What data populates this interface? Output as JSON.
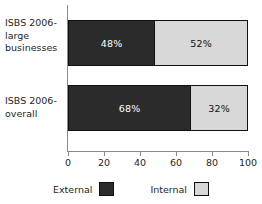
{
  "chart_data": {
    "type": "bar",
    "orientation": "horizontal",
    "stacked": true,
    "percent": true,
    "title": "",
    "subtitle": "",
    "xlabel": "",
    "ylabel": "",
    "categories": [
      "ISBS 2006-large businesses",
      "ISBS 2006-overall"
    ],
    "category_lines": [
      [
        "ISBS 2006-",
        "large",
        "businesses"
      ],
      [
        "ISBS 2006-",
        "overall"
      ]
    ],
    "series": [
      {
        "name": "External",
        "values": [
          48,
          52
        ],
        "color": "#2b2b2b"
      },
      {
        "name": "Internal",
        "values": [
          52,
          32
        ],
        "color": "#d8d8d8"
      }
    ],
    "bars": [
      {
        "category": "ISBS 2006-large businesses",
        "segments": [
          {
            "name": "External",
            "value": 48,
            "label": "48%"
          },
          {
            "name": "Internal",
            "value": 52,
            "label": "52%"
          }
        ]
      },
      {
        "category": "ISBS 2006-overall",
        "segments": [
          {
            "name": "External",
            "value": 68,
            "label": "68%"
          },
          {
            "name": "Internal",
            "value": 32,
            "label": "32%"
          }
        ]
      }
    ],
    "xlim": [
      0,
      100
    ],
    "xticks": [
      0,
      20,
      40,
      60,
      80,
      100
    ],
    "xtick_labels": [
      "0",
      "20",
      "40",
      "60",
      "80",
      "100"
    ],
    "grid": false,
    "legend": {
      "position": "bottom",
      "entries": [
        {
          "label": "External",
          "color": "#2b2b2b"
        },
        {
          "label": "Internal",
          "color": "#d8d8d8"
        }
      ]
    },
    "colors": {
      "external": "#2b2b2b",
      "internal": "#d8d8d8",
      "axis": "#8a8a8a",
      "outline": "#111111",
      "background": "#ffffff",
      "text": "#262626"
    }
  }
}
